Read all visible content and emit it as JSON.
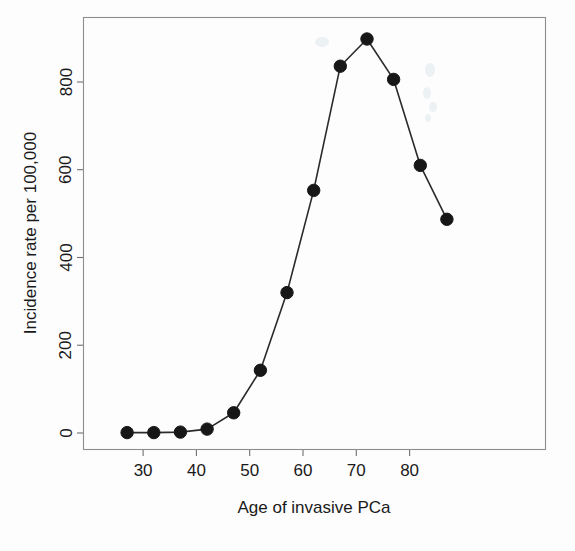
{
  "chart_data": {
    "type": "line",
    "title": "",
    "xlabel": "Age of invasive PCa",
    "ylabel": "Incidence rate per 100,000",
    "x": [
      27,
      32,
      37,
      42,
      47,
      52,
      57,
      62,
      67,
      72,
      77,
      82,
      87
    ],
    "values": [
      1,
      1,
      2,
      9,
      46,
      143,
      320,
      553,
      836,
      898,
      806,
      610,
      487
    ],
    "series": [
      {
        "name": "Incidence rate per 100,000",
        "values": [
          1,
          1,
          2,
          9,
          46,
          143,
          320,
          553,
          836,
          898,
          806,
          610,
          487
        ]
      }
    ],
    "xlim": [
      24.5,
      89.5
    ],
    "ylim": [
      -40,
      940
    ],
    "xticks": [
      30,
      40,
      50,
      60,
      70,
      80
    ],
    "xtick_labels": [
      "30",
      "40",
      "50",
      "60",
      "70",
      "80"
    ],
    "yticks": [
      0,
      200,
      400,
      600,
      800
    ],
    "ytick_labels": [
      "0",
      "200",
      "400",
      "600",
      "800"
    ],
    "grid": false,
    "legend": "none",
    "marker": "filled-circle",
    "line_color": "#2a2a2a",
    "marker_color": "#171717",
    "frame_color": "#8d8d8d"
  },
  "axes": {
    "x_title": "Age of invasive PCa",
    "y_title": "Incidence rate per 100,000",
    "x_tick_labels": [
      "30",
      "40",
      "50",
      "60",
      "70",
      "80"
    ],
    "y_tick_labels": [
      "0",
      "200",
      "400",
      "600",
      "800"
    ]
  }
}
